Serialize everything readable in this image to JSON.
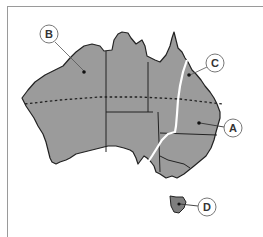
{
  "map": {
    "subject": "Australia",
    "land_color": "#9b9b9b",
    "border_color": "#222222",
    "range_line_color": "#ffffff",
    "tropic_line": "dashed",
    "labels": [
      {
        "id": "A",
        "text": "A"
      },
      {
        "id": "B",
        "text": "B"
      },
      {
        "id": "C",
        "text": "C"
      },
      {
        "id": "D",
        "text": "D"
      }
    ]
  }
}
